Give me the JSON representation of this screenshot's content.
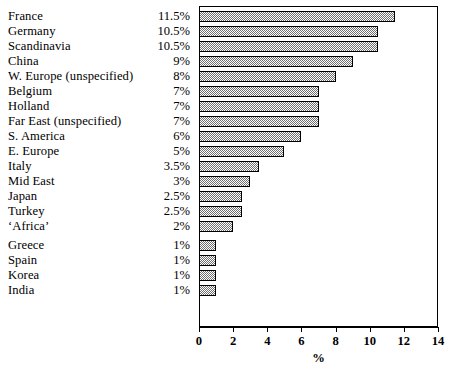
{
  "chart_data": {
    "type": "bar",
    "orientation": "horizontal",
    "title": "",
    "xlabel": "%",
    "ylabel": "",
    "xlim": [
      0,
      14
    ],
    "xticks": [
      0,
      2,
      4,
      6,
      8,
      10,
      12,
      14
    ],
    "grid": false,
    "legend": null,
    "categories": [
      "France",
      "Germany",
      "Scandinavia",
      "China",
      "W. Europe (unspecified)",
      "Belgium",
      "Holland",
      "Far East (unspecified)",
      "S. America",
      "E. Europe",
      "Italy",
      "Mid East",
      "Japan",
      "Turkey",
      "‘Africa’",
      "Greece",
      "Spain",
      "Korea",
      "India"
    ],
    "values": [
      11.5,
      10.5,
      10.5,
      9,
      8,
      7,
      7,
      7,
      6,
      5,
      3.5,
      3,
      2.5,
      2.5,
      2,
      1,
      1,
      1,
      1
    ],
    "value_labels": [
      "11.5%",
      "10.5%",
      "10.5%",
      "9%",
      "8%",
      "7%",
      "7%",
      "7%",
      "6%",
      "5%",
      "3.5%",
      "3%",
      "2.5%",
      "2.5%",
      "2%",
      "1%",
      "1%",
      "1%",
      "1%"
    ],
    "xtick_labels": [
      "0",
      "2",
      "4",
      "6",
      "8",
      "10",
      "12",
      "14"
    ],
    "bar_style": {
      "fill": "stipple-halftone",
      "fill_color": "#b8b8b8",
      "edge_color": "#000000"
    },
    "group_break_after_index": 14
  }
}
